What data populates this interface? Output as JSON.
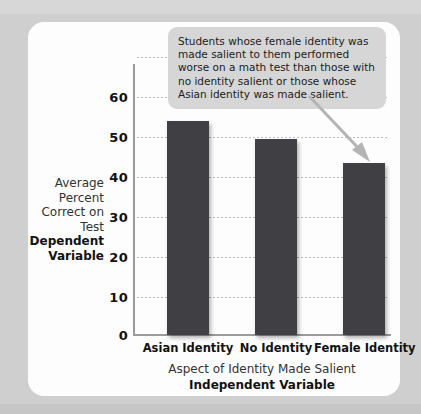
{
  "chart_data": {
    "type": "bar",
    "title": "",
    "categories": [
      "Asian Identity",
      "No Identity",
      "Female Identity"
    ],
    "values": [
      53.5,
      49,
      43
    ],
    "xlabel": "Aspect of Identity Made Salient",
    "xlabel_bold": "Independent Variable",
    "ylabel": "Average Percent Correct on Test",
    "ylabel_bold": "Dependent Variable",
    "ylim": [
      0,
      60
    ],
    "yticks": [
      0,
      10,
      20,
      30,
      40,
      50,
      60
    ],
    "ytick_labels": [
      "0",
      "10",
      "20",
      "30",
      "40",
      "50",
      "60"
    ],
    "grid": true,
    "legend": "none",
    "bar_color": "#3f3f44",
    "annotations": [
      {
        "text": "Students whose female identity was made salient to them performed worse on a math test than those with no identity salient or those whose Asian identity was made salient.",
        "points_to": "Female Identity"
      }
    ]
  },
  "colors": {
    "page_background": "#cfcfcf",
    "card_background": "#fdfdfd",
    "bar": "#3f3f44",
    "axis": "#9a9a9a",
    "gridline": "#bdbdbd",
    "callout_background": "#d6d6d6",
    "arrow": "#b4b4b4"
  }
}
